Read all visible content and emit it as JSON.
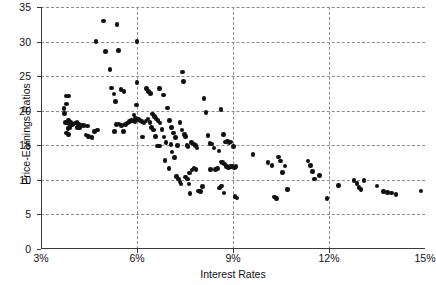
{
  "chart_data": {
    "type": "scatter",
    "title": "",
    "xlabel": "Interest Rates",
    "ylabel": "Price-Earnings Ratios",
    "xlim": [
      3,
      15
    ],
    "ylim": [
      0,
      35
    ],
    "xticks": [
      3,
      6,
      9,
      12,
      15
    ],
    "xtick_labels": [
      "3%",
      "6%",
      "9%",
      "12%",
      "15%"
    ],
    "yticks": [
      0,
      5,
      10,
      15,
      20,
      25,
      30,
      35
    ],
    "ytick_labels": [
      "0",
      "5",
      "10",
      "15",
      "20",
      "25",
      "30",
      "35"
    ],
    "grid": true,
    "grid_style": "dashed",
    "legend": null,
    "marker_color": "#111111",
    "marker_shape": "circle",
    "n_points": 178,
    "points": [
      [
        3.72,
        20.3
      ],
      [
        3.78,
        22.1
      ],
      [
        3.86,
        22.1
      ],
      [
        3.8,
        21.0
      ],
      [
        3.74,
        19.6
      ],
      [
        3.86,
        18.6
      ],
      [
        3.76,
        18.3
      ],
      [
        3.82,
        18.2
      ],
      [
        3.88,
        18.1
      ],
      [
        3.94,
        18.3
      ],
      [
        3.98,
        18.0
      ],
      [
        3.9,
        17.6
      ],
      [
        3.84,
        17.4
      ],
      [
        3.8,
        16.8
      ],
      [
        3.86,
        16.6
      ],
      [
        4.06,
        18.2
      ],
      [
        4.12,
        18.3
      ],
      [
        4.18,
        18.1
      ],
      [
        4.12,
        17.6
      ],
      [
        4.2,
        17.5
      ],
      [
        4.26,
        17.9
      ],
      [
        4.34,
        17.9
      ],
      [
        4.46,
        17.8
      ],
      [
        4.4,
        16.5
      ],
      [
        4.48,
        16.3
      ],
      [
        4.6,
        16.1
      ],
      [
        4.68,
        17.0
      ],
      [
        4.76,
        17.2
      ],
      [
        4.72,
        30.0
      ],
      [
        4.96,
        33.0
      ],
      [
        5.02,
        28.6
      ],
      [
        5.16,
        26.0
      ],
      [
        5.2,
        23.3
      ],
      [
        5.28,
        22.4
      ],
      [
        5.32,
        21.3
      ],
      [
        5.38,
        32.5
      ],
      [
        5.42,
        28.7
      ],
      [
        5.5,
        23.1
      ],
      [
        5.6,
        22.8
      ],
      [
        5.36,
        18.0
      ],
      [
        5.44,
        18.1
      ],
      [
        5.52,
        17.9
      ],
      [
        5.58,
        17.0
      ],
      [
        5.64,
        18.0
      ],
      [
        5.7,
        18.2
      ],
      [
        5.76,
        18.4
      ],
      [
        5.82,
        18.6
      ],
      [
        5.88,
        18.5
      ],
      [
        5.94,
        18.4
      ],
      [
        6.0,
        30.0
      ],
      [
        6.0,
        24.1
      ],
      [
        5.98,
        20.8
      ],
      [
        5.9,
        19.4
      ],
      [
        5.96,
        18.9
      ],
      [
        6.04,
        18.7
      ],
      [
        6.1,
        18.6
      ],
      [
        6.16,
        18.4
      ],
      [
        6.22,
        18.2
      ],
      [
        6.28,
        18.5
      ],
      [
        6.34,
        18.8
      ],
      [
        6.4,
        18.3
      ],
      [
        6.46,
        17.6
      ],
      [
        6.52,
        17.2
      ],
      [
        6.58,
        16.3
      ],
      [
        6.3,
        23.2
      ],
      [
        6.36,
        22.8
      ],
      [
        6.42,
        22.5
      ],
      [
        6.48,
        19.5
      ],
      [
        6.54,
        19.2
      ],
      [
        6.6,
        18.9
      ],
      [
        6.66,
        18.6
      ],
      [
        6.72,
        18.2
      ],
      [
        6.78,
        17.3
      ],
      [
        6.84,
        16.2
      ],
      [
        6.9,
        15.4
      ],
      [
        6.7,
        23.2
      ],
      [
        6.82,
        22.3
      ],
      [
        6.96,
        20.4
      ],
      [
        7.02,
        18.6
      ],
      [
        7.08,
        17.6
      ],
      [
        7.14,
        16.8
      ],
      [
        7.2,
        16.1
      ],
      [
        7.26,
        15.0
      ],
      [
        6.88,
        12.8
      ],
      [
        7.0,
        11.6
      ],
      [
        7.1,
        14.0
      ],
      [
        7.18,
        13.2
      ],
      [
        7.24,
        10.5
      ],
      [
        7.3,
        10.1
      ],
      [
        7.34,
        9.7
      ],
      [
        7.38,
        9.4
      ],
      [
        7.42,
        25.6
      ],
      [
        7.46,
        24.2
      ],
      [
        7.34,
        18.3
      ],
      [
        7.4,
        17.2
      ],
      [
        7.48,
        16.6
      ],
      [
        7.52,
        16.3
      ],
      [
        7.56,
        15.0
      ],
      [
        7.6,
        14.8
      ],
      [
        7.64,
        11.0
      ],
      [
        7.52,
        10.4
      ],
      [
        7.58,
        10.1
      ],
      [
        7.62,
        9.4
      ],
      [
        7.66,
        8.0
      ],
      [
        7.72,
        11.4
      ],
      [
        7.78,
        11.7
      ],
      [
        7.84,
        11.5
      ],
      [
        7.7,
        15.4
      ],
      [
        7.76,
        15.2
      ],
      [
        7.82,
        15.0
      ],
      [
        7.88,
        14.6
      ],
      [
        7.92,
        8.4
      ],
      [
        7.98,
        8.3
      ],
      [
        8.04,
        9.0
      ],
      [
        8.1,
        21.8
      ],
      [
        8.16,
        19.7
      ],
      [
        8.22,
        16.4
      ],
      [
        8.28,
        15.3
      ],
      [
        8.34,
        15.2
      ],
      [
        8.4,
        14.6
      ],
      [
        8.46,
        11.5
      ],
      [
        8.52,
        11.6
      ],
      [
        8.58,
        8.8
      ],
      [
        8.64,
        9.1
      ],
      [
        8.7,
        16.6
      ],
      [
        8.76,
        15.5
      ],
      [
        8.82,
        15.6
      ],
      [
        8.88,
        15.4
      ],
      [
        8.94,
        15.5
      ],
      [
        8.62,
        12.6
      ],
      [
        8.68,
        12.5
      ],
      [
        8.74,
        12.3
      ],
      [
        8.8,
        11.9
      ],
      [
        8.86,
        11.8
      ],
      [
        8.92,
        11.9
      ],
      [
        8.56,
        14.2
      ],
      [
        8.62,
        20.2
      ],
      [
        8.98,
        11.9
      ],
      [
        9.04,
        11.8
      ],
      [
        9.1,
        11.9
      ],
      [
        8.72,
        8.1
      ],
      [
        9.02,
        14.8
      ],
      [
        9.06,
        7.6
      ],
      [
        9.12,
        7.4
      ],
      [
        9.62,
        13.7
      ],
      [
        10.1,
        12.5
      ],
      [
        10.22,
        12.1
      ],
      [
        10.3,
        7.5
      ],
      [
        10.36,
        7.3
      ],
      [
        10.42,
        13.3
      ],
      [
        10.48,
        12.7
      ],
      [
        10.54,
        11.1
      ],
      [
        10.62,
        12.0
      ],
      [
        10.7,
        8.6
      ],
      [
        11.34,
        12.7
      ],
      [
        11.42,
        12.1
      ],
      [
        11.48,
        11.2
      ],
      [
        11.54,
        10.1
      ],
      [
        11.7,
        10.6
      ],
      [
        11.94,
        7.3
      ],
      [
        12.3,
        9.2
      ],
      [
        12.78,
        9.9
      ],
      [
        12.88,
        9.5
      ],
      [
        12.94,
        8.9
      ],
      [
        13.0,
        8.6
      ],
      [
        13.1,
        9.9
      ],
      [
        13.5,
        9.1
      ],
      [
        13.7,
        8.3
      ],
      [
        13.82,
        8.2
      ],
      [
        13.96,
        8.1
      ],
      [
        14.1,
        7.9
      ],
      [
        14.88,
        8.4
      ],
      [
        6.64,
        14.9
      ],
      [
        6.7,
        14.9
      ],
      [
        5.3,
        17.0
      ],
      [
        7.06,
        15.1
      ],
      [
        8.3,
        11.5
      ],
      [
        6.18,
        16.2
      ]
    ]
  }
}
